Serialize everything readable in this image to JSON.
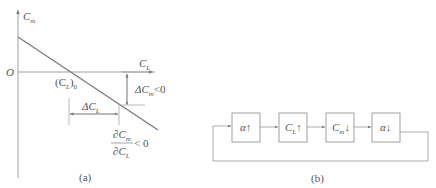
{
  "panel_a": {
    "caption": "(a)",
    "y_axis": {
      "symbol": "C",
      "sub": "m"
    },
    "x_axis": {
      "symbol": "C",
      "sub": "L"
    },
    "origin": "O",
    "intercept_label": {
      "open": "(C",
      "sub": "L",
      "close": ")",
      "sub2": "0"
    },
    "delta_cm": {
      "prefix": "ΔC",
      "sub": "m",
      "suffix": "<0"
    },
    "delta_cl": {
      "prefix": "ΔC",
      "sub": "L"
    },
    "derivative": {
      "num": "∂C",
      "num_sub": "m",
      "den": "∂C",
      "den_sub": "L",
      "rel": "< 0"
    }
  },
  "panel_b": {
    "caption": "(b)",
    "blocks": [
      {
        "symbol": "α",
        "sub": "",
        "arrow": "↑"
      },
      {
        "symbol": "C",
        "sub": "L",
        "arrow": "↑"
      },
      {
        "symbol": "C",
        "sub": "m",
        "arrow": "↓"
      },
      {
        "symbol": "α",
        "sub": "",
        "arrow": "↓"
      }
    ]
  },
  "colors": {
    "line": "#777777",
    "text": "#555555"
  }
}
